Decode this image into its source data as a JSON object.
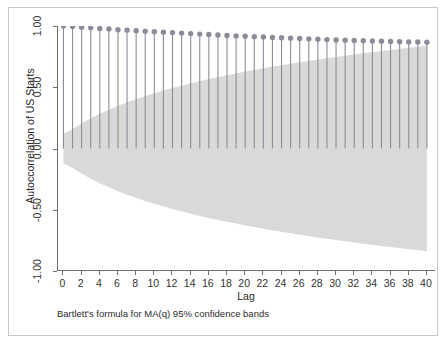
{
  "figure": {
    "background_color": "#ffffff",
    "frame_color": "#c8c8c8",
    "axis_color": "#6e6e6e"
  },
  "chart_data": {
    "type": "bar",
    "title": "",
    "subtitle": "",
    "xlabel": "Lag",
    "ylabel": "Autoccorrelation of US Starts",
    "note": "Bartlett's formula for MA(q) 95% confidence bands",
    "grid": false,
    "legend": "none",
    "marker_color": "#8c8c99",
    "stem_color": "#8c8c99",
    "band_color": "#d9d9d9",
    "xlim": [
      -0.6,
      41.0
    ],
    "ylim": [
      -1.0,
      1.0
    ],
    "xticks": [
      0,
      2,
      4,
      6,
      8,
      10,
      12,
      14,
      16,
      18,
      20,
      22,
      24,
      26,
      28,
      30,
      32,
      34,
      36,
      38,
      40
    ],
    "xtick_labels": [
      "0",
      "2",
      "4",
      "6",
      "8",
      "10",
      "12",
      "14",
      "16",
      "18",
      "20",
      "22",
      "24",
      "26",
      "28",
      "30",
      "32",
      "34",
      "36",
      "38",
      "40"
    ],
    "yticks": [
      -1.0,
      -0.5,
      0.0,
      0.5,
      1.0
    ],
    "ytick_labels": [
      "-1.00",
      "-0.50",
      "0.00",
      "0.50",
      "1.00"
    ],
    "categories": [
      0,
      1,
      2,
      3,
      4,
      5,
      6,
      7,
      8,
      9,
      10,
      11,
      12,
      13,
      14,
      15,
      16,
      17,
      18,
      19,
      20,
      21,
      22,
      23,
      24,
      25,
      26,
      27,
      28,
      29,
      30,
      31,
      32,
      33,
      34,
      35,
      36,
      37,
      38,
      39,
      40
    ],
    "values": [
      1.0,
      0.995,
      0.99,
      0.985,
      0.98,
      0.975,
      0.97,
      0.966,
      0.962,
      0.958,
      0.954,
      0.95,
      0.946,
      0.942,
      0.938,
      0.934,
      0.93,
      0.926,
      0.922,
      0.919,
      0.916,
      0.913,
      0.91,
      0.907,
      0.904,
      0.901,
      0.898,
      0.895,
      0.892,
      0.889,
      0.886,
      0.884,
      0.882,
      0.88,
      0.878,
      0.876,
      0.874,
      0.872,
      0.87,
      0.869,
      0.868
    ],
    "confidence_band_upper": [
      0.118,
      0.16,
      0.205,
      0.246,
      0.283,
      0.317,
      0.348,
      0.377,
      0.403,
      0.428,
      0.451,
      0.473,
      0.494,
      0.513,
      0.532,
      0.55,
      0.567,
      0.583,
      0.598,
      0.613,
      0.628,
      0.641,
      0.655,
      0.668,
      0.68,
      0.692,
      0.704,
      0.715,
      0.726,
      0.737,
      0.747,
      0.757,
      0.767,
      0.777,
      0.786,
      0.796,
      0.805,
      0.813,
      0.822,
      0.83,
      0.838
    ],
    "confidence_band_lower": [
      -0.118,
      -0.16,
      -0.205,
      -0.246,
      -0.283,
      -0.317,
      -0.348,
      -0.377,
      -0.403,
      -0.428,
      -0.451,
      -0.473,
      -0.494,
      -0.513,
      -0.532,
      -0.55,
      -0.567,
      -0.583,
      -0.598,
      -0.613,
      -0.628,
      -0.641,
      -0.655,
      -0.668,
      -0.68,
      -0.692,
      -0.704,
      -0.715,
      -0.726,
      -0.737,
      -0.747,
      -0.757,
      -0.767,
      -0.777,
      -0.786,
      -0.796,
      -0.805,
      -0.813,
      -0.822,
      -0.83,
      -0.838
    ]
  }
}
